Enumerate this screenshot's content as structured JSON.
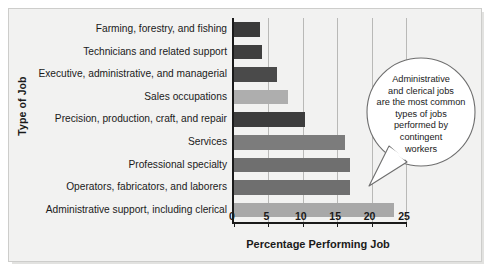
{
  "chart_data": {
    "type": "bar",
    "orientation": "horizontal",
    "title": "",
    "xlabel": "Percentage Performing Job",
    "ylabel": "Type of Job",
    "xlim": [
      0,
      25
    ],
    "xticks": [
      0,
      5,
      10,
      15,
      20,
      25
    ],
    "grid": true,
    "legend": "none",
    "categories": [
      "Farming, forestry, and fishing",
      "Technicians and related support",
      "Executive, administrative, and managerial",
      "Sales occupations",
      "Precision, production, craft, and repair",
      "Services",
      "Professional specialty",
      "Operators, fabricators, and laborers",
      "Administrative support, including clerical"
    ],
    "values": [
      3.8,
      4.0,
      6.3,
      7.8,
      10.3,
      16.1,
      16.8,
      16.8,
      23.2
    ],
    "bar_colors": [
      "#3a3a3a",
      "#3f3f3f",
      "#4a4a4a",
      "#aeaeae",
      "#3d3d3d",
      "#7c7c7c",
      "#6f6f6f",
      "#6f6f6f",
      "#a8a8a8"
    ],
    "annotations": [
      {
        "text": "Administrative and clerical jobs are the most common types of jobs performed by contingent workers",
        "lines": [
          "Administrative",
          "and clerical jobs",
          "are the most common",
          "types of jobs",
          "performed by",
          "contingent",
          "workers"
        ],
        "points_to": "Administrative support, including clerical"
      }
    ]
  },
  "colors": {
    "panel_background": "#f2f2f1",
    "panel_border": "#cdcdcb",
    "axis": "#1a1a1a",
    "gridline": "#b9b9b7",
    "text": "#1a1a1a",
    "callout_outline": "#6e6e6e"
  }
}
